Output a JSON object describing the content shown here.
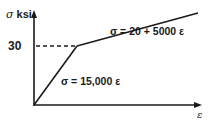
{
  "diagram": {
    "type": "stress-strain bilinear curve",
    "y_axis": {
      "label_symbol": "σ",
      "label_unit": "ksi"
    },
    "x_axis": {
      "label_symbol": "ε"
    },
    "tick_y": "30",
    "segments": [
      {
        "name": "elastic",
        "equation": "σ = 15,000 ε"
      },
      {
        "name": "plastic",
        "equation": "σ = 20 + 5000 ε"
      }
    ],
    "knee": {
      "stress": 30
    },
    "colors": {
      "line": "#1a1a1a",
      "background": "#ffffff"
    }
  }
}
